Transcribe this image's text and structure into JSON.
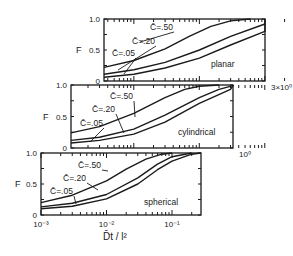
{
  "chart_data": [
    {
      "type": "line",
      "panel": "planar",
      "annotation": "planar",
      "ylabel": "F",
      "yticks": [
        "0",
        "0.5",
        "1.0"
      ],
      "ylim": [
        0,
        1.0
      ],
      "xscale": "log",
      "xlim": [
        0.0035,
        3.0
      ],
      "xtick_label_right": "3×10⁰",
      "series": [
        {
          "name": "C̄=.50",
          "x": [
            0.0035,
            0.01,
            0.03,
            0.07,
            0.15,
            0.3,
            0.6
          ],
          "y": [
            0.22,
            0.33,
            0.52,
            0.72,
            0.88,
            0.97,
            1.0
          ]
        },
        {
          "name": "C̄=.20",
          "x": [
            0.0035,
            0.01,
            0.03,
            0.1,
            0.3,
            1.0,
            3.0
          ],
          "y": [
            0.11,
            0.18,
            0.3,
            0.5,
            0.72,
            0.92,
            1.0
          ]
        },
        {
          "name": "C̄=.05",
          "x": [
            0.0035,
            0.01,
            0.03,
            0.1,
            0.3,
            1.0,
            3.0
          ],
          "y": [
            0.06,
            0.11,
            0.21,
            0.37,
            0.58,
            0.8,
            0.92
          ]
        }
      ]
    },
    {
      "type": "line",
      "panel": "cylindrical",
      "annotation": "cylindrical",
      "ylabel": "F",
      "yticks": [
        "0",
        "0.5",
        "1.0"
      ],
      "ylim": [
        0,
        1.0
      ],
      "xscale": "log",
      "xlim": [
        0.0011,
        1.0
      ],
      "xtick_label_right": "10⁰",
      "series": [
        {
          "name": "C̄=.50",
          "x": [
            0.0011,
            0.003,
            0.01,
            0.03,
            0.06,
            0.1,
            0.2
          ],
          "y": [
            0.24,
            0.34,
            0.55,
            0.8,
            0.93,
            0.98,
            1.0
          ]
        },
        {
          "name": "C̄=.20",
          "x": [
            0.0011,
            0.003,
            0.01,
            0.03,
            0.1,
            0.2,
            0.4,
            1.0
          ],
          "y": [
            0.12,
            0.17,
            0.3,
            0.52,
            0.8,
            0.93,
            0.99,
            1.0
          ]
        },
        {
          "name": "C̄=.05",
          "x": [
            0.0011,
            0.003,
            0.01,
            0.03,
            0.1,
            0.3,
            0.6,
            1.0
          ],
          "y": [
            0.08,
            0.12,
            0.22,
            0.41,
            0.71,
            0.93,
            0.99,
            1.0
          ]
        }
      ]
    },
    {
      "type": "line",
      "panel": "spherical",
      "annotation": "spherical",
      "title": "",
      "xlabel": "D̄t / l²",
      "ylabel": "F",
      "yticks": [
        "0",
        "0.5",
        "1.0"
      ],
      "ylim": [
        0,
        1.0
      ],
      "xscale": "log",
      "xlim": [
        0.001,
        0.29
      ],
      "xticks": [
        "10⁻³",
        "10⁻²",
        "10⁻¹"
      ],
      "series": [
        {
          "name": "C̄=.50",
          "x": [
            0.001,
            0.003,
            0.01,
            0.02,
            0.04,
            0.07,
            0.1
          ],
          "y": [
            0.2,
            0.32,
            0.55,
            0.74,
            0.9,
            0.98,
            1.0
          ]
        },
        {
          "name": "C̄=.20",
          "x": [
            0.001,
            0.003,
            0.01,
            0.03,
            0.06,
            0.1,
            0.2
          ],
          "y": [
            0.13,
            0.19,
            0.33,
            0.6,
            0.82,
            0.94,
            1.0
          ]
        },
        {
          "name": "C̄=.05",
          "x": [
            0.001,
            0.003,
            0.01,
            0.03,
            0.06,
            0.1,
            0.2,
            0.29
          ],
          "y": [
            0.1,
            0.14,
            0.26,
            0.5,
            0.73,
            0.87,
            0.98,
            1.0
          ]
        }
      ]
    }
  ],
  "labels": {
    "ylabel": "F",
    "xlabel": "D̄t / l²",
    "curve_labels": [
      "C̄=.50",
      "C̄=.20",
      "C̄=.05"
    ]
  }
}
